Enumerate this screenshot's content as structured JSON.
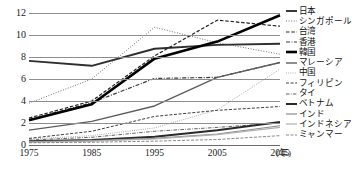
{
  "chart_data": {
    "type": "line",
    "title": "",
    "xlabel": "年",
    "ylabel": "",
    "x": [
      1975,
      1985,
      1995,
      2005,
      2015
    ],
    "xtick_labels": [
      "1975",
      "1985",
      "1995",
      "2005",
      "2015"
    ],
    "xaxis_unit": "(年)",
    "ytick_labels": [
      "0",
      "2",
      "4",
      "6",
      "8",
      "10",
      "12"
    ],
    "ytick_values": [
      0,
      2,
      4,
      6,
      8,
      10,
      12
    ],
    "ylim": [
      0,
      12
    ],
    "xlim": [
      1975,
      2015
    ],
    "grid": true,
    "legend_position": "right",
    "series": [
      {
        "name": "日本",
        "values": [
          7.65,
          7.2,
          8.75,
          9.1,
          9.2
        ],
        "color": "#2e2e2e",
        "width": 1.9,
        "dash": "none"
      },
      {
        "name": "シンガポール",
        "values": [
          3.8,
          6.0,
          10.7,
          9.3,
          8.25
        ],
        "color": "#4a4a4a",
        "width": 0.8,
        "dash": "1,1.6"
      },
      {
        "name": "台湾",
        "values": [
          2.45,
          4.0,
          8.1,
          11.35,
          10.8
        ],
        "color": "#222222",
        "width": 1.2,
        "dash": "3.5,1.8"
      },
      {
        "name": "香港",
        "values": [
          2.3,
          3.85,
          6.05,
          6.15,
          7.5
        ],
        "color": "#3a3a3a",
        "width": 1.2,
        "dash": "4,1.5,1,1.5"
      },
      {
        "name": "韓国",
        "values": [
          2.25,
          3.7,
          7.85,
          9.4,
          11.8
        ],
        "color": "#000000",
        "width": 2.6,
        "dash": "none"
      },
      {
        "name": "マレーシア",
        "values": [
          1.35,
          2.15,
          3.55,
          6.15,
          7.5
        ],
        "color": "#5d5d5d",
        "width": 1.4,
        "dash": "none"
      },
      {
        "name": "中国",
        "values": [
          0.55,
          0.85,
          1.55,
          3.2,
          6.9
        ],
        "color": "#9a9a9a",
        "width": 1.0,
        "dash": "0.8,1.4"
      },
      {
        "name": "フィリピン",
        "values": [
          0.6,
          1.25,
          2.6,
          3.15,
          3.5
        ],
        "color": "#3f3f3f",
        "width": 1.0,
        "dash": "3,1.6"
      },
      {
        "name": "タイ",
        "values": [
          0.45,
          0.7,
          1.25,
          1.6,
          2.0
        ],
        "color": "#4f4f4f",
        "width": 0.9,
        "dash": "3.5,1.3,0.8,1.3"
      },
      {
        "name": "ベトナム",
        "values": [
          0.35,
          0.45,
          0.75,
          1.35,
          2.1
        ],
        "color": "#2a2a2a",
        "width": 2.0,
        "dash": "none"
      },
      {
        "name": "インド",
        "values": [
          0.3,
          0.4,
          0.6,
          1.0,
          1.75
        ],
        "color": "#8a8a8a",
        "width": 1.2,
        "dash": "none"
      },
      {
        "name": "インドネシア",
        "values": [
          0.25,
          0.35,
          0.55,
          0.95,
          1.6
        ],
        "color": "#b0b0b0",
        "width": 1.2,
        "dash": "none"
      },
      {
        "name": "ミャンマー",
        "values": [
          0.2,
          0.25,
          0.35,
          0.5,
          0.85
        ],
        "color": "#7a7a7a",
        "width": 0.9,
        "dash": "3,1.5"
      }
    ]
  },
  "legend": {
    "items": [
      {
        "label": "日本"
      },
      {
        "label": "シンガポール"
      },
      {
        "label": "台湾"
      },
      {
        "label": "香港"
      },
      {
        "label": "韓国"
      },
      {
        "label": "マレーシア"
      },
      {
        "label": "中国"
      },
      {
        "label": "フィリピン"
      },
      {
        "label": "タイ"
      },
      {
        "label": "ベトナム"
      },
      {
        "label": "インド"
      },
      {
        "label": "インドネシア"
      },
      {
        "label": "ミャンマー"
      }
    ]
  },
  "source_note": ""
}
